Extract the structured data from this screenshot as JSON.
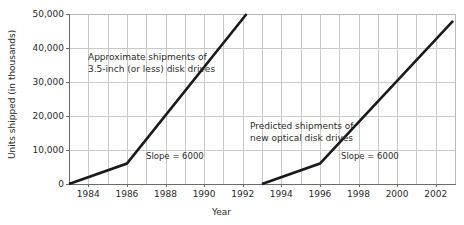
{
  "chart_data": {
    "type": "line",
    "title": "",
    "xlabel": "Year",
    "ylabel": "Units shipped (in thousands)",
    "xlim": [
      1983,
      2003
    ],
    "ylim": [
      0,
      50000
    ],
    "grid": true,
    "legend": "none",
    "x_ticks": [
      1984,
      1986,
      1988,
      1990,
      1992,
      1994,
      1996,
      1998,
      2000,
      2002
    ],
    "x_tick_labels": [
      "1984",
      "1986",
      "1988",
      "1990",
      "1992",
      "1994",
      "1996",
      "1998",
      "2000",
      "2002"
    ],
    "y_ticks": [
      0,
      10000,
      20000,
      30000,
      40000,
      50000
    ],
    "y_tick_labels": [
      "0",
      "10,000",
      "20,000",
      "30,000",
      "40,000",
      "50,000"
    ],
    "series": [
      {
        "name": "Approximate shipments of 3.5-inch (or less) disk drives",
        "x": [
          1983,
          1986,
          1992.2
        ],
        "values": [
          0,
          6000,
          50000
        ]
      },
      {
        "name": "Predicted shipments of new optical disk drives",
        "x": [
          1993,
          1996,
          2002.9
        ],
        "values": [
          0,
          6000,
          48000
        ]
      }
    ],
    "annotations": [
      {
        "name": "series-1-label",
        "line1": "Approximate shipments of",
        "line2": "3.5-inch (or less) disk drives"
      },
      {
        "name": "series-2-label",
        "line1": "Predicted shipments of",
        "line2": "new optical disk drives"
      },
      {
        "name": "slope-label-1",
        "text": "Slope = 6000"
      },
      {
        "name": "slope-label-2",
        "text": "Slope = 6000"
      }
    ],
    "colors": {
      "line": "#1a1a1a",
      "grid": "#c9c9c9",
      "axis": "#6b6b6b",
      "text": "#2b2b2b",
      "background": "#ffffff"
    }
  }
}
